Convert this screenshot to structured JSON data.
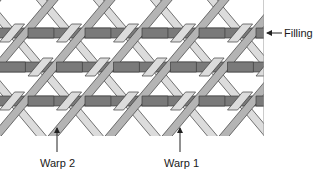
{
  "figure": {
    "type": "triaxial-weave-diagram",
    "labels": {
      "filling": "Filling",
      "warp2": "Warp 2",
      "warp1": "Warp 1"
    },
    "colors": {
      "filling": "#7a7a7a",
      "warp_right": "#b4b4b4",
      "warp_left": "#dcdcdc",
      "outline": "#3c3c3c",
      "arrow": "#222222"
    },
    "pattern": {
      "x_min": 0,
      "x_max": 264,
      "y_min": 0,
      "y_max": 136,
      "filling_rows_y": [
        28,
        62,
        96
      ],
      "filling_band_height": 10,
      "warp_spacing": 57,
      "warp_width": 10
    },
    "arrows": {
      "filling": {
        "x1": 282,
        "y1": 33,
        "x2": 267,
        "y2": 33
      },
      "warp2": {
        "x1": 57,
        "y1": 152,
        "x2": 57,
        "y2": 128
      },
      "warp1": {
        "x1": 180,
        "y1": 152,
        "x2": 180,
        "y2": 128
      }
    }
  }
}
